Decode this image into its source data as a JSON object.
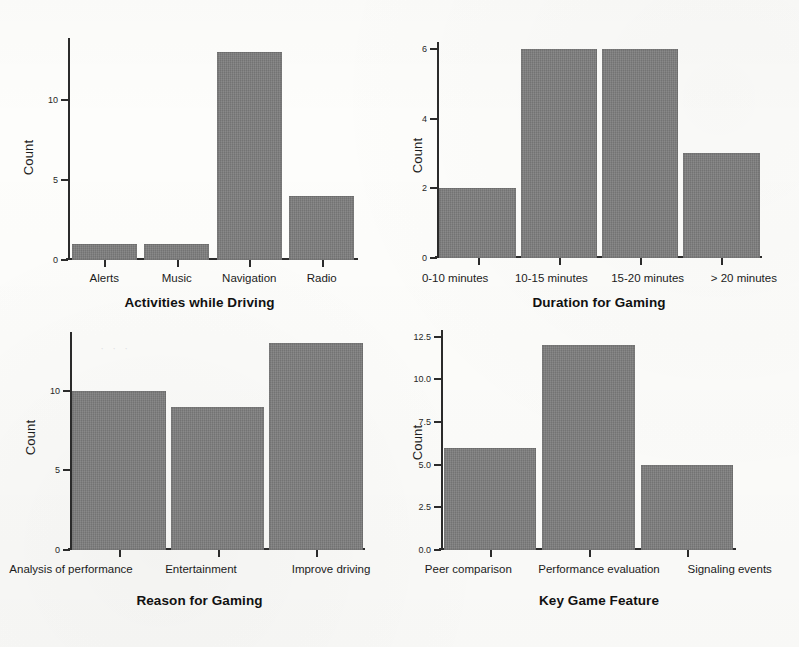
{
  "figure": {
    "panel_count": 4,
    "bar_color": "#7e7e7e",
    "axis_color": "#2b2b2b",
    "background": "#fdfdfb"
  },
  "charts": [
    {
      "id": "activities-while-driving",
      "title": "Activities while Driving",
      "ylabel": "Count",
      "type": "bar",
      "categories": [
        "Alerts",
        "Music",
        "Navigation",
        "Radio"
      ],
      "values": [
        1,
        1,
        13,
        4
      ],
      "yticks": [
        "0",
        "5",
        "10"
      ],
      "ytick_values": [
        0,
        5,
        10
      ],
      "ylim": [
        0,
        13.9
      ],
      "grid": false,
      "legend": false
    },
    {
      "id": "duration-for-gaming",
      "title": "Duration for Gaming",
      "ylabel": "Count",
      "type": "bar",
      "categories": [
        "0-10 minutes",
        "10-15 minutes",
        "15-20 minutes",
        "> 20 minutes"
      ],
      "values": [
        2,
        6,
        6,
        3
      ],
      "yticks": [
        "0",
        "2",
        "4",
        "6"
      ],
      "ytick_values": [
        0,
        2,
        4,
        6
      ],
      "ylim": [
        0,
        6.2
      ],
      "grid": false,
      "legend": false
    },
    {
      "id": "reason-for-gaming",
      "title": "Reason for Gaming",
      "ylabel": "Count",
      "type": "bar",
      "categories": [
        "Analysis of performance",
        "Entertainment",
        "Improve driving"
      ],
      "values": [
        10,
        9,
        13
      ],
      "yticks": [
        "0",
        "5",
        "10"
      ],
      "ytick_values": [
        0,
        5,
        10
      ],
      "ylim": [
        0,
        13.7
      ],
      "grid": false,
      "legend": false
    },
    {
      "id": "key-game-feature",
      "title": "Key Game Feature",
      "ylabel": "Count",
      "type": "bar",
      "categories": [
        "Peer comparison",
        "Performance evaluation",
        "Signaling events"
      ],
      "values": [
        6,
        12,
        5
      ],
      "yticks": [
        "0.0",
        "2.5",
        "5.0",
        "7.5",
        "10.0",
        "12.5"
      ],
      "ytick_values": [
        0,
        2.5,
        5,
        7.5,
        10,
        12.5
      ],
      "ylim": [
        0,
        12.9
      ],
      "grid": false,
      "legend": false
    }
  ],
  "chart_data": [
    {
      "type": "bar",
      "title": "Activities while Driving",
      "xlabel": "Activities while Driving",
      "ylabel": "Count",
      "categories": [
        "Alerts",
        "Music",
        "Navigation",
        "Radio"
      ],
      "values": [
        1,
        1,
        13,
        4
      ],
      "ylim": [
        0,
        13.9
      ],
      "yticks": [
        0,
        5,
        10
      ],
      "grid": false,
      "legend_position": "none"
    },
    {
      "type": "bar",
      "title": "Duration for Gaming",
      "xlabel": "Duration for Gaming",
      "ylabel": "Count",
      "categories": [
        "0-10 minutes",
        "10-15 minutes",
        "15-20 minutes",
        "> 20 minutes"
      ],
      "values": [
        2,
        6,
        6,
        3
      ],
      "ylim": [
        0,
        6.2
      ],
      "yticks": [
        0,
        2,
        4,
        6
      ],
      "grid": false,
      "legend_position": "none"
    },
    {
      "type": "bar",
      "title": "Reason for Gaming",
      "xlabel": "Reason for Gaming",
      "ylabel": "Count",
      "categories": [
        "Analysis of performance",
        "Entertainment",
        "Improve driving"
      ],
      "values": [
        10,
        9,
        13
      ],
      "ylim": [
        0,
        13.7
      ],
      "yticks": [
        0,
        5,
        10
      ],
      "grid": false,
      "legend_position": "none"
    },
    {
      "type": "bar",
      "title": "Key Game Feature",
      "xlabel": "Key Game Feature",
      "ylabel": "Count",
      "categories": [
        "Peer comparison",
        "Performance evaluation",
        "Signaling events"
      ],
      "values": [
        6,
        12,
        5
      ],
      "ylim": [
        0,
        12.9
      ],
      "yticks": [
        0,
        2.5,
        5,
        7.5,
        10,
        12.5
      ],
      "grid": false,
      "legend_position": "none"
    }
  ]
}
